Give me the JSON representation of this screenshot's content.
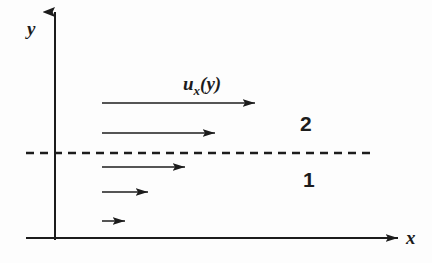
{
  "figure": {
    "type": "diagram",
    "background_color": "#fdfdfd",
    "ink_color": "#1c1c1c"
  },
  "axes": {
    "x_label": "x",
    "y_label": "y",
    "origin": {
      "x": 55,
      "y": 238
    },
    "x_axis": {
      "start_x": 26,
      "end_x": 398,
      "y": 238,
      "arrowhead": "right"
    },
    "y_axis": {
      "x": 55,
      "start_y": 238,
      "end_y": 10,
      "arrowhead": "up"
    }
  },
  "interface": {
    "style": "dashed",
    "y": 153,
    "start_x": 26,
    "end_x": 376,
    "dash_length": 8,
    "gap_length": 6
  },
  "flow_label": {
    "base": "u",
    "subscript": "x",
    "argument": "(y)",
    "full_text": "u_x(y)",
    "x": 183,
    "y": 90
  },
  "region_labels": [
    {
      "name": "upper-region",
      "text": "2",
      "x": 300,
      "y": 131
    },
    {
      "name": "lower-region",
      "text": "1",
      "x": 303,
      "y": 187
    }
  ],
  "velocity_arrows": [
    {
      "index": 1,
      "region": "upper",
      "start_x": 102,
      "end_x": 255,
      "y": 103,
      "length": 153
    },
    {
      "index": 2,
      "region": "upper",
      "start_x": 102,
      "end_x": 215,
      "y": 133,
      "length": 113
    },
    {
      "index": 3,
      "region": "lower",
      "start_x": 102,
      "end_x": 185,
      "y": 167,
      "length": 83
    },
    {
      "index": 4,
      "region": "lower",
      "start_x": 102,
      "end_x": 148,
      "y": 192,
      "length": 46
    },
    {
      "index": 5,
      "region": "lower",
      "start_x": 102,
      "end_x": 125,
      "y": 221,
      "length": 23
    }
  ]
}
